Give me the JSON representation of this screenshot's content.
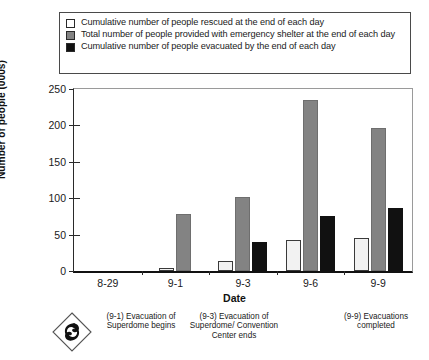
{
  "legend": {
    "position": "top",
    "items": [
      {
        "swatch": "white",
        "label": "Cumulative number of people rescued at the end of each day"
      },
      {
        "swatch": "gray",
        "label": "Total number of people provided with emergency shelter at the end of each day"
      },
      {
        "swatch": "black",
        "label": "Cumulative number of people evacuated by the end of each day"
      }
    ]
  },
  "axes": {
    "y_title": "Number of people (000s)",
    "x_title": "Date",
    "y_ticks": [
      "0",
      "50",
      "100",
      "150",
      "200",
      "250"
    ]
  },
  "annotations": [
    {
      "text": "(9-1) Evacuation of Superdome begins"
    },
    {
      "text": "(9-3) Evacuation of Superdome/ Convention Center ends"
    },
    {
      "text": "(9-9) Evacuations completed"
    }
  ],
  "storm_icon": "hurricane-icon",
  "colors": {
    "rescued": "#f2f2f2",
    "shelter": "#838383",
    "evacuated": "#111111",
    "axis": "#1a1a1a",
    "frame": "#9a9a9a"
  },
  "chart_data": {
    "type": "bar",
    "title": "",
    "xlabel": "Date",
    "ylabel": "Number of people (000s)",
    "categories": [
      "8-29",
      "9-1",
      "9-3",
      "9-6",
      "9-9"
    ],
    "ylim": [
      0,
      250
    ],
    "yticks": [
      0,
      50,
      100,
      150,
      200,
      250
    ],
    "grid": false,
    "legend_position": "top",
    "series": [
      {
        "name": "Cumulative number of people rescued at the end of each day",
        "color": "#f2f2f2",
        "values": [
          0,
          4,
          14,
          43,
          46
        ]
      },
      {
        "name": "Total number of people provided with emergency shelter at the end of each day",
        "color": "#838383",
        "values": [
          0,
          78,
          101,
          235,
          197
        ]
      },
      {
        "name": "Cumulative number of people evacuated by the end of each day",
        "color": "#111111",
        "values": [
          0,
          0,
          40,
          76,
          86
        ]
      }
    ],
    "annotations": [
      {
        "category": "9-1",
        "text": "(9-1) Evacuation of Superdome begins"
      },
      {
        "category": "9-3",
        "text": "(9-3) Evacuation of Superdome/ Convention Center ends"
      },
      {
        "category": "9-9",
        "text": "(9-9) Evacuations completed"
      }
    ]
  }
}
